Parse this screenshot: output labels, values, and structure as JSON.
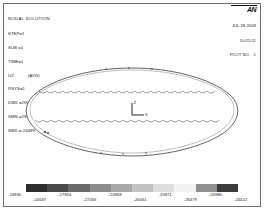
{
  "window": {
    "title": "NODAL SOLUTION",
    "frame_color": "#6e6e6e",
    "background": "#ffffff"
  },
  "info": {
    "title": "NODAL SOLUTION",
    "step": "STEP=1",
    "sub": "SUB =1",
    "time": "TIME=1",
    "result_item": "UZ",
    "result_unit": "(AVG)",
    "rsys": "RSYS=1",
    "dmx": "DMX =29027",
    "smn": "SMN =29930",
    "smx": "SMX =-24489"
  },
  "logo": {
    "mark": "AN",
    "name": "ansys-logo"
  },
  "stamp": {
    "date": "JUL 18 2009",
    "time": "10:25:11",
    "plot_no": "PLOT NO.   1"
  },
  "plot": {
    "shape": "elliptical-shell-mesh",
    "edge_style": "scalloped",
    "line_color": "#3a3a3a",
    "fill_color": "#ffffff"
  },
  "triad": {
    "axis_vertical_label": "Z",
    "axis_horizontal_label": "X"
  },
  "chart_data": {
    "type": "heatmap",
    "title": "NODAL SOLUTION",
    "xlabel": "",
    "ylabel": "",
    "legend_orientation": "horizontal",
    "legend_position": "bottom",
    "colormap": "grayscale",
    "bands": [
      "#2e2e2e",
      "#4a4a4a",
      "#6a6a6a",
      "#8c8c8c",
      "#a8a8a8",
      "#c2c2c2",
      "#dedede",
      "#f2f2f2",
      "#8f8f8f",
      "#3c3c3c"
    ],
    "tick_labels": [
      "-24930",
      "-24637",
      "-27944",
      "-27456",
      "-24958",
      "-26461",
      "-25971",
      "-25479",
      "-24986",
      "-24422"
    ],
    "tick_rows": [
      0,
      1,
      0,
      1,
      0,
      1,
      0,
      1,
      0,
      1
    ],
    "value_min": "-29930",
    "value_max": "-24489"
  }
}
